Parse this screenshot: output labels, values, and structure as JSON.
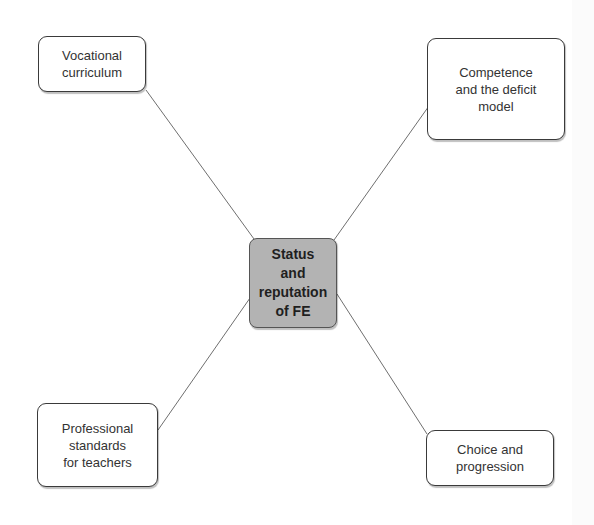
{
  "diagram": {
    "type": "mind-map",
    "central": {
      "label": "Status\nand\nreputation\nof FE",
      "fill": "#b3b3b3"
    },
    "branches": [
      {
        "id": "top-left",
        "label": "Vocational\ncurriculum"
      },
      {
        "id": "top-right",
        "label": "Competence\nand the deficit\nmodel"
      },
      {
        "id": "bottom-left",
        "label": "Professional\nstandards\nfor teachers"
      },
      {
        "id": "bottom-right",
        "label": "Choice and\nprogression"
      }
    ],
    "colors": {
      "line": "#6f6f6f",
      "border": "#3a3a3a",
      "background": "#ffffff"
    }
  }
}
